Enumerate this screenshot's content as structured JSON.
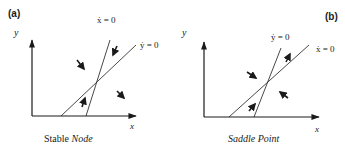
{
  "panels": [
    {
      "id": "a",
      "tag": "(a)",
      "caption_plain": "Stable ",
      "caption_italic": "Node",
      "y_axis_label": "y",
      "x_axis_label": "x",
      "steep_line_label": "ẋ = 0",
      "shallow_line_label": "ẏ = 0"
    },
    {
      "id": "b",
      "tag": "(b)",
      "caption_plain": "",
      "caption_italic": "Saddle Point",
      "y_axis_label": "y",
      "x_axis_label": "x",
      "steep_line_label": "ẏ = 0",
      "shallow_line_label": "ẋ = 0"
    }
  ],
  "colors": {
    "ink": "#1a1a1a",
    "background": "#ffffff"
  }
}
